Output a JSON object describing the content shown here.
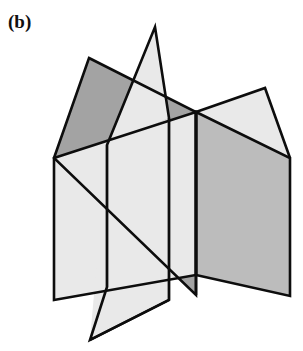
{
  "figure": {
    "label": "(b)",
    "caption_text": "(b)",
    "background_color": "#ffffff",
    "line_color": "#0d0d0d"
  },
  "palette": {
    "light_gray": "#e9e9e9",
    "mid_gray": "#bcbcbc",
    "dark_gray": "#a3a3a3",
    "outline": "#0d0d0d",
    "white": "#ffffff"
  },
  "geometry": {
    "units": "pixels",
    "canvas": {
      "width": 303,
      "height": 351
    },
    "planes": [
      {
        "name": "back-plane",
        "fill": "#a3a3a3",
        "points": "89,58 196,112 196,295 54,158"
      },
      {
        "name": "horizontal-plane-left",
        "fill": "#e9e9e9",
        "points": "54,158 196,112 196,275 54,300"
      },
      {
        "name": "horizontal-plane-right",
        "fill": "#bcbcbc",
        "points": "196,112 290,158 290,296 196,275"
      },
      {
        "name": "upper-right-wing",
        "fill": "#e9e9e9",
        "points": "196,112 265,88 290,158"
      },
      {
        "name": "tilted-plane",
        "fill": "#e9e9e9",
        "points": "155,27 169,118 107,287 90,340"
      }
    ],
    "edges": [
      {
        "name": "back-plane-outline",
        "d": "M89,58 L196,112 L196,295 L54,158 Z"
      },
      {
        "name": "horizontal-left-outline",
        "d": "M54,158 L196,112 L196,275 L54,300 Z"
      },
      {
        "name": "horizontal-right-outline",
        "d": "M196,112 L290,158 L290,296 L196,275 Z"
      },
      {
        "name": "wing-outline",
        "d": "M196,112 L265,88 L290,158"
      },
      {
        "name": "tilted-plane-outline",
        "d": "M155,27 L169,118 L169,300 L90,340 L107,287 L107,145 Z"
      },
      {
        "name": "central-vertical-seam",
        "d": "M196,112 L196,295"
      }
    ]
  }
}
